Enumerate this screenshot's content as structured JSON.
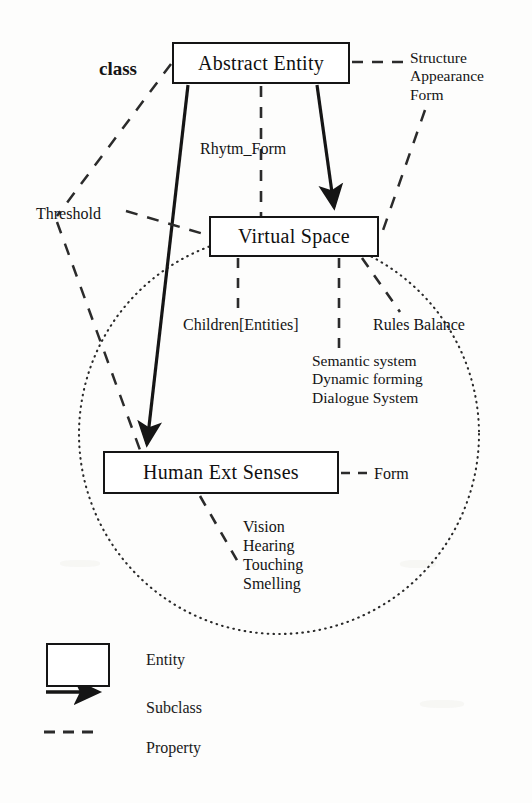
{
  "diagram": {
    "colors": {
      "ink": "#151515",
      "background": "#fdfdfc"
    },
    "entities": [
      {
        "id": "abstract-entity",
        "label": "Abstract Entity"
      },
      {
        "id": "virtual-space",
        "label": "Virtual Space"
      },
      {
        "id": "human-ext-senses",
        "label": "Human  Ext Senses"
      }
    ],
    "labels": {
      "class": "class",
      "threshold": "Threshold",
      "rhytm_form": "Rhytm_Form",
      "children_entities": "Children[Entities]",
      "rules_balance": "Rules Balance",
      "form": "Form",
      "structure_group": "Structure\nAppearance\nForm",
      "semantic_group": "Semantic system\nDynamic forming\nDialogue System",
      "senses_group": "Vision\nHearing\nTouching\nSmelling"
    },
    "legend": {
      "items": [
        {
          "id": "entity",
          "glyph": "rectangle-glyph",
          "label": "Entity"
        },
        {
          "id": "subclass",
          "glyph": "solid-arrow-glyph",
          "label": "Subclass"
        },
        {
          "id": "property",
          "glyph": "dashed-line-glyph",
          "label": "Property"
        }
      ]
    },
    "relations": [
      {
        "type": "subclass",
        "from": "abstract-entity",
        "to": "human-ext-senses"
      },
      {
        "type": "subclass",
        "from": "abstract-entity",
        "to": "virtual-space"
      },
      {
        "type": "property",
        "from": "abstract-entity",
        "to": "rhytm_form"
      },
      {
        "type": "property",
        "from": "abstract-entity",
        "to": "structure_group"
      },
      {
        "type": "property",
        "from": "abstract-entity",
        "to": "class"
      },
      {
        "type": "property",
        "from": "virtual-space",
        "to": "threshold"
      },
      {
        "type": "property",
        "from": "virtual-space",
        "to": "children_entities"
      },
      {
        "type": "property",
        "from": "virtual-space",
        "to": "semantic_group"
      },
      {
        "type": "property",
        "from": "virtual-space",
        "to": "rules_balance"
      },
      {
        "type": "property",
        "from": "human-ext-senses",
        "to": "form"
      },
      {
        "type": "property",
        "from": "human-ext-senses",
        "to": "senses_group"
      }
    ],
    "scope_circle": {
      "shape": "dotted-circle",
      "cx": 279,
      "cy": 434,
      "r": 200
    }
  }
}
